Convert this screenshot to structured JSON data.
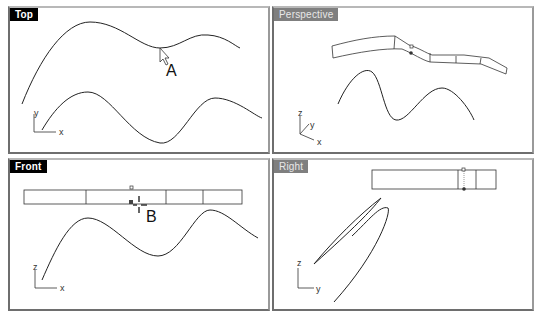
{
  "viewports": {
    "top": {
      "label": "Top",
      "active": true,
      "axes": {
        "vertical": "y",
        "horizontal": "x"
      },
      "callout": "A"
    },
    "perspective": {
      "label": "Perspective",
      "active": false,
      "axes": {
        "vertical": "z",
        "depth": "y",
        "horizontal": "x"
      }
    },
    "front": {
      "label": "Front",
      "active": false,
      "axes": {
        "vertical": "z",
        "horizontal": "x"
      },
      "callout": "B"
    },
    "right": {
      "label": "Right",
      "active": false,
      "axes": {
        "vertical": "z",
        "horizontal": "y"
      }
    }
  },
  "colors": {
    "active_label_bg": "#000000",
    "inactive_label_bg": "#7f7f7f",
    "curve": "#222222",
    "viewport_bg": "#ffffff"
  }
}
